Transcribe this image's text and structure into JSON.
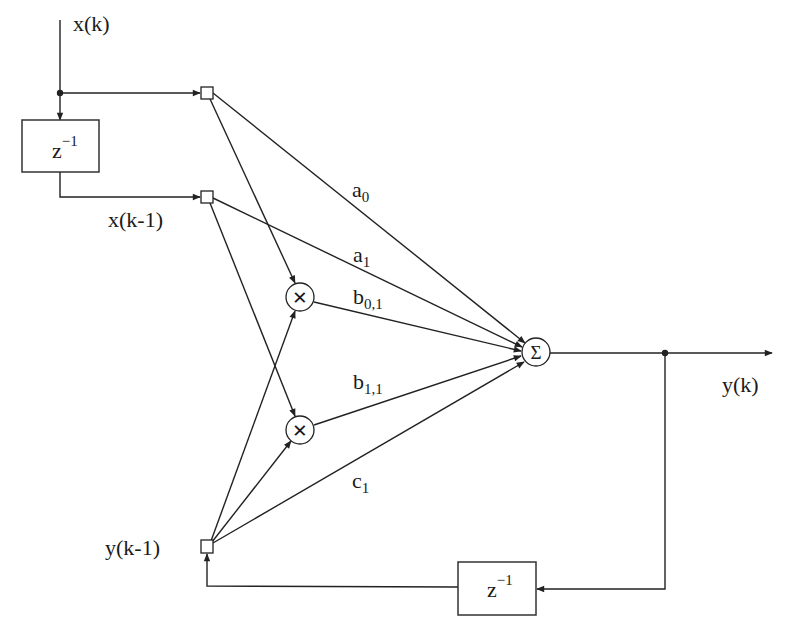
{
  "diagram": {
    "title": "",
    "inputs": {
      "x_k": "x(k)",
      "x_k1": "x(k-1)",
      "y_k1": "y(k-1)"
    },
    "output": {
      "y_k": "y(k)"
    },
    "delay_blocks": [
      {
        "id": "delay-input",
        "base": "z",
        "exponent": "−1"
      },
      {
        "id": "delay-feedback",
        "base": "z",
        "exponent": "−1"
      }
    ],
    "operators": {
      "multiplier_symbol": "×",
      "summer_symbol": "Σ"
    },
    "weights": [
      {
        "id": "a0",
        "base": "a",
        "sub": "0"
      },
      {
        "id": "a1",
        "base": "a",
        "sub": "1"
      },
      {
        "id": "b01",
        "base": "b",
        "sub": "0,1"
      },
      {
        "id": "b11",
        "base": "b",
        "sub": "1,1"
      },
      {
        "id": "c1",
        "base": "c",
        "sub": "1"
      }
    ],
    "colors": {
      "line": "#222222",
      "background": "#ffffff"
    }
  }
}
